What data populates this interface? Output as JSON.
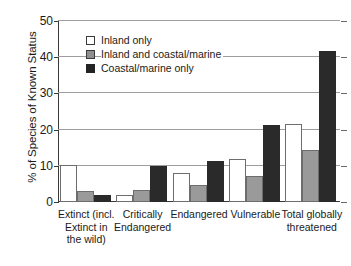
{
  "chart_data": {
    "type": "bar",
    "title": "",
    "xlabel": "",
    "ylabel": "% of Species of Known Status",
    "ylim": [
      0,
      50
    ],
    "yticks": [
      0,
      10,
      20,
      30,
      40,
      50
    ],
    "ytick_labels": [
      "0",
      "10",
      "20",
      "30",
      "40",
      "50"
    ],
    "grid": true,
    "legend_position": "upper-left-inside",
    "categories": [
      "Extinct (incl. Extinct in the wild)",
      "Critically Endangered",
      "Endangered",
      "Vulnerable",
      "Total globally threatened"
    ],
    "category_label_lines": [
      [
        "Extinct (incl.",
        "Extinct in",
        "the wild)"
      ],
      [
        "Critically",
        "Endangered"
      ],
      [
        "Endangered"
      ],
      [
        "Vulnerable"
      ],
      [
        "Total globally",
        "threatened"
      ]
    ],
    "series": [
      {
        "name": "Inland only",
        "color": "#ffffff",
        "values": [
          10.2,
          1.9,
          8.0,
          11.9,
          21.6
        ]
      },
      {
        "name": "Inland and coastal/marine",
        "color": "#9a9a9a",
        "values": [
          3.0,
          3.2,
          4.7,
          7.2,
          14.3
        ]
      },
      {
        "name": "Coastal/marine only",
        "color": "#2a2a2a",
        "values": [
          1.8,
          10.0,
          11.3,
          21.4,
          41.8
        ]
      }
    ]
  },
  "legend": {
    "items": [
      {
        "label": "Inland only",
        "swatch": "inland"
      },
      {
        "label": "Inland and coastal/marine",
        "swatch": "both"
      },
      {
        "label": "Coastal/marine only",
        "swatch": "coastal"
      }
    ]
  },
  "colors": {
    "inland_only": "#ffffff",
    "inland_and_coastal": "#9a9a9a",
    "coastal_only": "#2a2a2a",
    "axis": "#3a3a3a",
    "gridline": "#9d9d9d"
  }
}
